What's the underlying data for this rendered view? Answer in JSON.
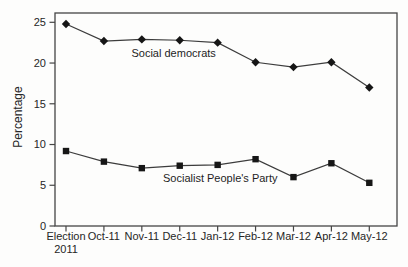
{
  "figure": {
    "background": "#fdfdfc",
    "ink": "#262626",
    "line_color": "#3c3c3c",
    "marker_color": "#161616"
  },
  "chart_data": {
    "type": "line",
    "title": "",
    "xlabel": "",
    "ylabel": "Percentage",
    "ylim": [
      0,
      25
    ],
    "yticks": [
      0,
      5,
      10,
      15,
      20,
      25
    ],
    "grid": false,
    "legend": "inline-annotations",
    "categories": [
      "Election\n2011",
      "Oct-11",
      "Nov-11",
      "Dec-11",
      "Jan-12",
      "Feb-12",
      "Mar-12",
      "Apr-12",
      "May-12"
    ],
    "series": [
      {
        "name": "Social democrats",
        "marker": "diamond",
        "color": "#3c3c3c",
        "values": [
          24.8,
          22.7,
          22.9,
          22.8,
          22.5,
          20.1,
          19.5,
          20.1,
          17.0
        ],
        "label": {
          "text": "Social democrats",
          "x_category": 2.84,
          "y_value": 21.2
        }
      },
      {
        "name": "Socialist People's Party",
        "marker": "square",
        "color": "#3c3c3c",
        "values": [
          9.2,
          7.9,
          7.1,
          7.4,
          7.5,
          8.2,
          6.0,
          7.7,
          5.3
        ],
        "label": {
          "text": "Socialist People's Party",
          "x_category": 4.07,
          "y_value": 5.9
        }
      }
    ]
  }
}
